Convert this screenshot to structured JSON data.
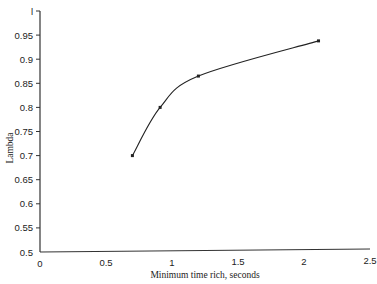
{
  "chart_data": {
    "type": "line",
    "title": "",
    "xlabel": "Minimum time rich, seconds",
    "ylabel": "Lambda",
    "xlim": [
      0,
      2.5
    ],
    "ylim": [
      0.5,
      1
    ],
    "grid": false,
    "legend": null,
    "x_ticks": [
      "0",
      "0.5",
      "1",
      "1.5",
      "2",
      "2.5"
    ],
    "y_ticks": [
      "1",
      "0.95",
      "0.9",
      "0.85",
      "0.8",
      "0.75",
      "0.7",
      "0.65",
      "0.6",
      "0.55",
      "0.5"
    ],
    "series": [
      {
        "name": "Lambda",
        "x": [
          0.7,
          0.91,
          1.2,
          2.11
        ],
        "y": [
          0.7,
          0.8,
          0.865,
          0.938
        ],
        "smooth": true,
        "markers": true,
        "color": "#222222"
      }
    ]
  }
}
